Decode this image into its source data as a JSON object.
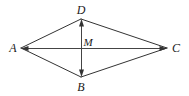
{
  "figure": {
    "type": "geometry-diagram",
    "shape_name": "rhombus-with-diagonals",
    "background_color": "#ffffff",
    "stroke_color": "#333333",
    "label_color": "#1a1a1a",
    "stroke_width": 1,
    "canvas": {
      "width": 189,
      "height": 96
    },
    "vertices": [
      {
        "id": "A",
        "label": "A",
        "x": 21,
        "y": 48,
        "label_x": 13,
        "label_y": 48,
        "arrowhead": true
      },
      {
        "id": "D",
        "label": "D",
        "x": 81,
        "y": 19,
        "label_x": 81,
        "label_y": 10,
        "arrowhead": true
      },
      {
        "id": "C",
        "label": "C",
        "x": 167,
        "y": 48,
        "label_x": 176,
        "label_y": 48,
        "arrowhead": true
      },
      {
        "id": "B",
        "label": "B",
        "x": 81,
        "y": 77,
        "label_x": 81,
        "label_y": 87,
        "arrowhead": true
      }
    ],
    "intersection": {
      "id": "M",
      "label": "M",
      "x": 81,
      "y": 48,
      "label_x": 88,
      "label_y": 42
    },
    "sides": [
      {
        "from": "A",
        "to": "D"
      },
      {
        "from": "D",
        "to": "C"
      },
      {
        "from": "C",
        "to": "B"
      },
      {
        "from": "B",
        "to": "A"
      }
    ],
    "diagonals": [
      {
        "id": "AC",
        "from": "A",
        "to": "C",
        "orientation": "horizontal"
      },
      {
        "id": "DB",
        "from": "D",
        "to": "B",
        "orientation": "vertical"
      }
    ]
  }
}
